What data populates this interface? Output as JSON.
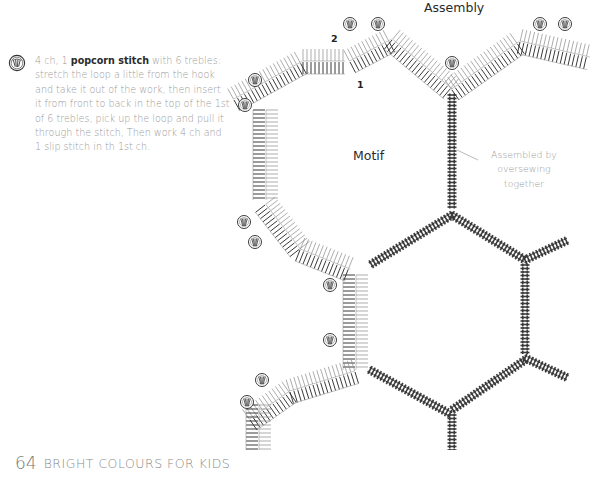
{
  "legend": {
    "icon": "popcorn-stitch-icon",
    "text_before": "4 ch, 1 ",
    "text_bold": "popcorn stitch",
    "text_after": " with 6 trebles: stretch the loop a little from the hook and take it out of the work, then insert it from front to back in the top of the 1st of 6 trebles, pick up the loop and pull it through the stitch, Then work 4 ch and 1 slip stitch in th 1st ch."
  },
  "diagram": {
    "title": "Assembly",
    "motif_label": "Motif",
    "annotation": "Assembled by oversewing together",
    "step_labels": [
      "1",
      "2"
    ],
    "colors": {
      "line": "#3a3a3a",
      "light_line": "#8a8a8a"
    }
  },
  "footer": {
    "page_number": "64",
    "book_title": "BRIGHT COLOURS FOR KIDS"
  }
}
